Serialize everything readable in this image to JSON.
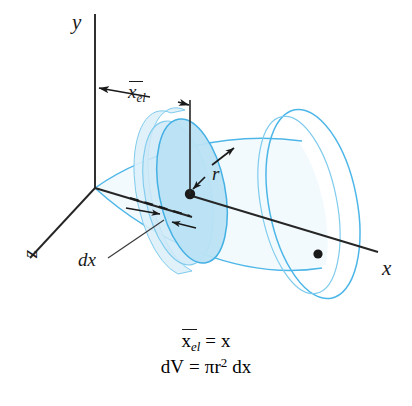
{
  "figure": {
    "background_color": "#ffffff",
    "axes": {
      "y_label": "y",
      "x_label": "x",
      "z_label": "z",
      "axis_color": "#262626"
    },
    "solid": {
      "name": "cone",
      "outline_color": "#4db6e8",
      "fill_color": "#cfe9f7",
      "disc_face_color": "#b5dff3",
      "disc_rim_color": "#ddf0fa"
    },
    "annotations": {
      "centroid_distance": {
        "label_base": "x",
        "label_sub": "el",
        "overbar": true
      },
      "radius": {
        "label": "r"
      },
      "thickness": {
        "label": "dx"
      }
    },
    "equations": [
      {
        "id": "centroid",
        "lhs_base": "x",
        "lhs_sub": "el",
        "overbar": true,
        "rel": "=",
        "rhs": "x"
      },
      {
        "id": "volume",
        "lhs": "dV",
        "rel": "=",
        "rhs_pi": "π",
        "rhs_r": "r",
        "rhs_exp": "2",
        "rhs_dx": "dx"
      }
    ]
  }
}
